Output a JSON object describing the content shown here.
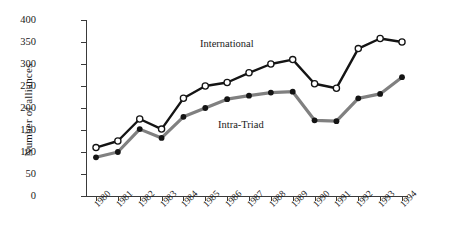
{
  "chart_data": {
    "type": "line",
    "title": "",
    "xlabel": "",
    "ylabel": "Number of alliances",
    "categories": [
      "1980",
      "1981",
      "1982",
      "1983",
      "1984",
      "1985",
      "1986",
      "1987",
      "1988",
      "1989",
      "1990",
      "1991",
      "1992",
      "1993",
      "1994"
    ],
    "ylim": [
      0,
      400
    ],
    "yticks": [
      0,
      50,
      100,
      150,
      200,
      250,
      300,
      350,
      400
    ],
    "grid": false,
    "legend_position": "inline-annotations",
    "series": [
      {
        "name": "International",
        "marker": "open-circle",
        "color": "#141414",
        "values": [
          110,
          125,
          175,
          152,
          222,
          250,
          258,
          280,
          300,
          310,
          255,
          245,
          335,
          358,
          350
        ]
      },
      {
        "name": "Intra-Triad",
        "marker": "filled-circle",
        "color": "#808080",
        "values": [
          88,
          100,
          152,
          132,
          180,
          200,
          220,
          228,
          235,
          237,
          172,
          170,
          222,
          232,
          270
        ]
      }
    ],
    "annotations": [
      {
        "text": "International",
        "series": "International"
      },
      {
        "text": "Intra-Triad",
        "series": "Intra-Triad"
      }
    ]
  },
  "colors": {
    "international_line": "#141414",
    "intratriad_line": "#808080",
    "marker_fill_open": "#ffffff",
    "marker_fill_solid": "#141414",
    "axis": "#3a3a3a",
    "background": "#ffffff"
  }
}
